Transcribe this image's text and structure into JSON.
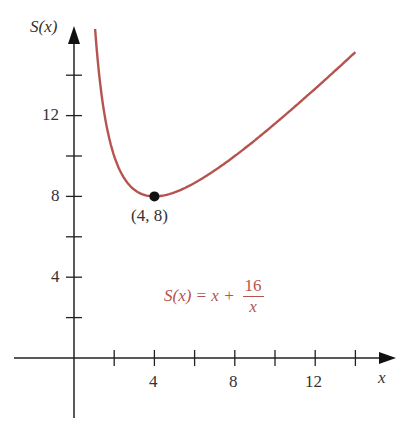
{
  "chart_data": {
    "type": "line",
    "title": "",
    "function": "S(x) = x + 16/x",
    "xlabel": "x",
    "ylabel": "S(x)",
    "x_ticks": [
      2,
      4,
      6,
      8,
      10,
      12,
      14
    ],
    "x_tick_labels": [
      "4",
      "8",
      "12"
    ],
    "y_ticks": [
      2,
      4,
      6,
      8,
      10,
      12,
      14
    ],
    "y_tick_labels": [
      "4",
      "8",
      "12"
    ],
    "xlim": [
      -2,
      16
    ],
    "ylim": [
      -3,
      16.5
    ],
    "grid": false,
    "series": [
      {
        "name": "S(x) = x + 16/x",
        "color": "#b5544f",
        "x": [
          1.05,
          1.5,
          2,
          3,
          4,
          5,
          6,
          8,
          10,
          12,
          14
        ],
        "values": [
          16.29,
          12.17,
          10,
          8.33,
          8,
          8.2,
          8.67,
          10,
          11.6,
          13.33,
          15.14
        ]
      }
    ],
    "annotations": [
      {
        "point": [
          4,
          8
        ],
        "label": "(4, 8)",
        "marker": "filled-circle"
      }
    ]
  },
  "labels": {
    "y_axis": "S(x)",
    "x_axis": "x",
    "point": "(4, 8)",
    "eq_lhs": "S(x) = x +",
    "eq_num": "16",
    "eq_den": "x",
    "xt4": "4",
    "xt8": "8",
    "xt12": "12",
    "yt4": "4",
    "yt8": "8",
    "yt12": "12"
  }
}
